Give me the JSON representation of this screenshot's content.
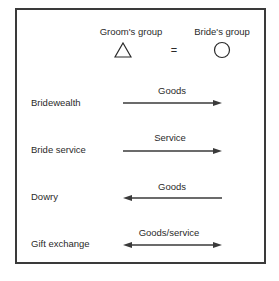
{
  "diagram": {
    "header": {
      "groom_group_label": "Groom's group",
      "bride_group_label": "Bride's group",
      "groom_symbol": "triangle",
      "bride_symbol": "circle",
      "relation_symbol": "="
    },
    "rows": [
      {
        "label": "Bridewealth",
        "flow_label": "Goods",
        "direction": "groom-to-bride"
      },
      {
        "label": "Bride service",
        "flow_label": "Service",
        "direction": "groom-to-bride"
      },
      {
        "label": "Dowry",
        "flow_label": "Goods",
        "direction": "bride-to-groom"
      },
      {
        "label": "Gift exchange",
        "flow_label": "Goods/service",
        "direction": "both"
      }
    ]
  }
}
